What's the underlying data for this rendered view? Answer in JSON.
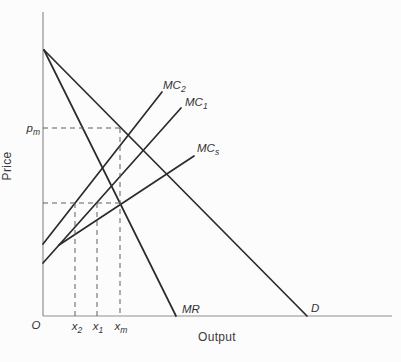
{
  "figure_title": "price-output diagram",
  "colors": {
    "background": "#fcfcfc",
    "curve": "#2b2b2b",
    "axis": "#8f8f8f",
    "dash": "#5f5f5f",
    "text": "#333333"
  },
  "axes": {
    "y_label": "Price",
    "x_label": "Output",
    "origin_label": "O"
  },
  "curve_labels": {
    "mc2": {
      "main": "MC",
      "sub": "2"
    },
    "mc1": {
      "main": "MC",
      "sub": "1"
    },
    "mcs": {
      "main": "MC",
      "sub": "s"
    },
    "mr": {
      "main": "MR",
      "sub": ""
    },
    "d": {
      "main": "D",
      "sub": ""
    }
  },
  "point_labels": {
    "pm": {
      "main": "p",
      "sub": "m"
    },
    "x2": {
      "main": "x",
      "sub": "2"
    },
    "x1": {
      "main": "x",
      "sub": "1"
    },
    "xm": {
      "main": "x",
      "sub": "m"
    }
  },
  "chart_data": {
    "type": "line",
    "title": "",
    "xlabel": "Output",
    "ylabel": "Price",
    "axis_ranges": "qualitative (no numeric scale)",
    "grid": false,
    "lines": [
      {
        "name": "y-axis",
        "kind": "axis",
        "points": [
          [
            43,
            12
          ],
          [
            43,
            316
          ]
        ]
      },
      {
        "name": "x-axis",
        "kind": "axis",
        "points": [
          [
            43,
            316
          ],
          [
            392,
            316
          ]
        ]
      },
      {
        "name": "demand-curve",
        "kind": "curve",
        "points": [
          [
            44,
            50
          ],
          [
            307,
            316
          ]
        ]
      },
      {
        "name": "mr-curve",
        "kind": "curve",
        "points": [
          [
            44,
            50
          ],
          [
            176,
            316
          ]
        ]
      },
      {
        "name": "mc2-curve",
        "kind": "curve",
        "points": [
          [
            43,
            244
          ],
          [
            162,
            92
          ]
        ]
      },
      {
        "name": "mc1-curve",
        "kind": "curve",
        "points": [
          [
            43,
            263
          ],
          [
            181,
            108
          ]
        ]
      },
      {
        "name": "mcs-curve",
        "kind": "curve",
        "points": [
          [
            59,
            245
          ],
          [
            194,
            156
          ]
        ]
      },
      {
        "name": "pm-dashed-hline",
        "kind": "dashed",
        "points": [
          [
            43,
            128
          ],
          [
            120,
            128
          ]
        ]
      },
      {
        "name": "xm-dashed-vline",
        "kind": "dashed",
        "points": [
          [
            120,
            128
          ],
          [
            120,
            316
          ]
        ]
      },
      {
        "name": "eq-dashed-hline",
        "kind": "dashed",
        "points": [
          [
            43,
            203
          ],
          [
            121,
            203
          ]
        ]
      },
      {
        "name": "x2-dashed-vline",
        "kind": "dashed",
        "points": [
          [
            75,
            203
          ],
          [
            75,
            316
          ]
        ]
      },
      {
        "name": "x1-dashed-vline",
        "kind": "dashed",
        "points": [
          [
            97,
            203
          ],
          [
            97,
            316
          ]
        ]
      }
    ],
    "labels": [
      {
        "name": "mc2-label",
        "ref": "curve_labels.mc2",
        "x": 163,
        "y": 89,
        "anchor": "start",
        "italic": true
      },
      {
        "name": "mc1-label",
        "ref": "curve_labels.mc1",
        "x": 185,
        "y": 106,
        "anchor": "start",
        "italic": true
      },
      {
        "name": "mcs-label",
        "ref": "curve_labels.mcs",
        "x": 197,
        "y": 152,
        "anchor": "start",
        "italic": true
      },
      {
        "name": "mr-label",
        "ref": "curve_labels.mr",
        "x": 182,
        "y": 313,
        "anchor": "start",
        "italic": true
      },
      {
        "name": "d-label",
        "ref": "curve_labels.d",
        "x": 311,
        "y": 312,
        "anchor": "start",
        "italic": true
      },
      {
        "name": "pm-label",
        "ref": "point_labels.pm",
        "x": 40,
        "y": 132,
        "anchor": "end",
        "italic": true
      },
      {
        "name": "x2-label",
        "ref": "point_labels.x2",
        "x": 77,
        "y": 330,
        "anchor": "middle",
        "italic": true
      },
      {
        "name": "x1-label",
        "ref": "point_labels.x1",
        "x": 98,
        "y": 330,
        "anchor": "middle",
        "italic": true
      },
      {
        "name": "xm-label",
        "ref": "point_labels.xm",
        "x": 121,
        "y": 330,
        "anchor": "middle",
        "italic": true
      },
      {
        "name": "origin-label",
        "ref": "axes.origin_label",
        "x": 36,
        "y": 329,
        "anchor": "middle",
        "italic": true
      },
      {
        "name": "x-axis-label",
        "ref": "axes.x_label",
        "x": 217,
        "y": 341,
        "anchor": "middle",
        "italic": false,
        "word": true
      },
      {
        "name": "y-axis-label",
        "ref": "axes.y_label",
        "x": 11,
        "y": 166,
        "anchor": "middle",
        "italic": false,
        "word": true,
        "rotate": -90
      }
    ],
    "key_relationships": [
      "D and MR originate from the same point on the Price axis",
      "MCs branches from MC1 at a kink (horizontal summation of MC1 and MC2)",
      "MR intersects MCs at output xm; price pm read off D above xm",
      "dashed guides: pm -> D at xm; eq MC level -> x2 on MC2 and x1 on MC1"
    ]
  }
}
